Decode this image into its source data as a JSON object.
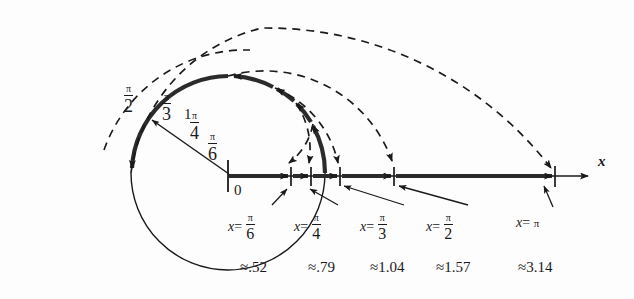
{
  "figure": {
    "background_color": "#fdfdfd",
    "ink_color": "#1a1a1a"
  },
  "circle": {
    "radius_label": "1",
    "center_label": "0"
  },
  "axis": {
    "label": "x"
  },
  "angle_marks": [
    {
      "name": "pi-over-2",
      "numerator": "π",
      "denominator": "2"
    },
    {
      "name": "pi-over-3",
      "numerator": "π",
      "denominator": "3"
    },
    {
      "name": "pi-over-4",
      "numerator": "π",
      "denominator": "4"
    },
    {
      "name": "pi-over-6",
      "numerator": "π",
      "denominator": "6"
    }
  ],
  "x_values": [
    {
      "name": "x-equals-pi-over-6",
      "prefix": "x",
      "equals": "=",
      "numerator": "π",
      "denominator": "6",
      "approx": "≈.52"
    },
    {
      "name": "x-equals-pi-over-4",
      "prefix": "x",
      "equals": "=",
      "numerator": "π",
      "denominator": "4",
      "approx": "≈.79"
    },
    {
      "name": "x-equals-pi-over-3",
      "prefix": "x",
      "equals": "=",
      "numerator": "π",
      "denominator": "3",
      "approx": "≈1.04"
    },
    {
      "name": "x-equals-pi-over-2",
      "prefix": "x",
      "equals": "=",
      "numerator": "π",
      "denominator": "2",
      "approx": "≈1.57"
    },
    {
      "name": "x-equals-pi",
      "prefix": "x",
      "equals": "=",
      "whole": "π",
      "approx": "≈3.14"
    }
  ]
}
